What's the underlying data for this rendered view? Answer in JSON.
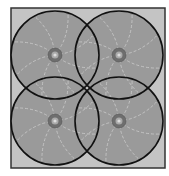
{
  "diagram": {
    "frame": {
      "x": 11,
      "y": 8,
      "width": 154,
      "height": 160,
      "fill": "#c4c4c4",
      "stroke": "#333333"
    },
    "circle_fill": "#9a9a9a",
    "circle_stroke": "#111111",
    "radius": 44,
    "circles": [
      {
        "id": "top-left",
        "cx": 55,
        "cy": 55
      },
      {
        "id": "top-right",
        "cx": 119,
        "cy": 55
      },
      {
        "id": "bottom-left",
        "cx": 55,
        "cy": 121
      },
      {
        "id": "bottom-right",
        "cx": 119,
        "cy": 121
      }
    ],
    "node": {
      "radius": 7,
      "fill": "#6e6e6e",
      "core": "#dddddd"
    }
  }
}
